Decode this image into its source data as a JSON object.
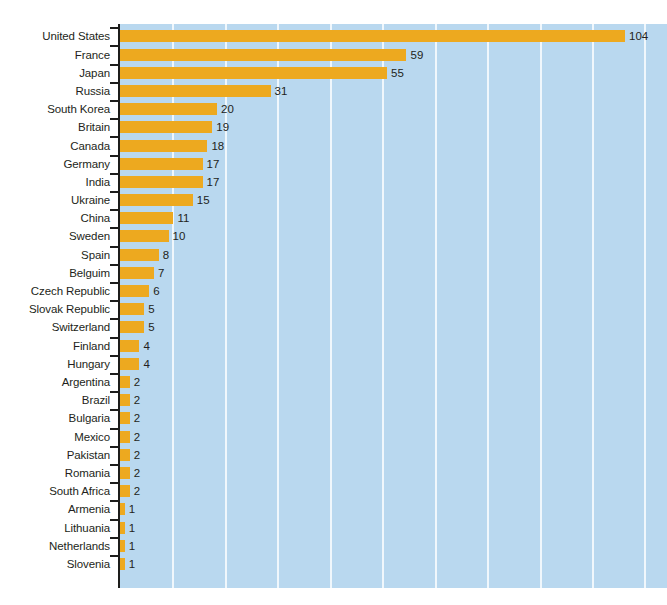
{
  "chart_data": {
    "type": "bar",
    "orientation": "horizontal",
    "title": "",
    "subtitle": "",
    "xlabel": "",
    "ylabel": "",
    "xlim": [
      0,
      112
    ],
    "grid": true,
    "grid_axis": "x",
    "legend": false,
    "bar_color": "#eda91f",
    "plot_background_color": "#b9d8ef",
    "gridline_color": "#f0f7fc",
    "axis_color": "#1d1d1b",
    "text_color": "#231f20",
    "page_background_color": "#ffffff",
    "value_labels_shown": true,
    "categories": [
      "United States",
      "France",
      "Japan",
      "Russia",
      "South Korea",
      "Britain",
      "Canada",
      "Germany",
      "India",
      "Ukraine",
      "China",
      "Sweden",
      "Spain",
      "Belguim",
      "Czech Republic",
      "Slovak Republic",
      "Switzerland",
      "Finland",
      "Hungary",
      "Argentina",
      "Brazil",
      "Bulgaria",
      "Mexico",
      "Pakistan",
      "Romania",
      "South Africa",
      "Armenia",
      "Lithuania",
      "Netherlands",
      "Slovenia"
    ],
    "values": [
      104,
      59,
      55,
      31,
      20,
      19,
      18,
      17,
      17,
      15,
      11,
      10,
      8,
      7,
      6,
      5,
      5,
      4,
      4,
      2,
      2,
      2,
      2,
      2,
      2,
      2,
      1,
      1,
      1,
      1
    ],
    "value_labels": [
      "104",
      "59",
      "55",
      "31",
      "20",
      "19",
      "18",
      "17",
      "17",
      "15",
      "11",
      "10",
      "8",
      "7",
      "6",
      "5",
      "5",
      "4",
      "4",
      "2",
      "2",
      "2",
      "2",
      "2",
      "2",
      "2",
      "1",
      "1",
      "1",
      "1"
    ],
    "gridline_values": [
      10.8,
      21.6,
      32.4,
      43.2,
      54,
      64.8,
      75.6,
      86.4,
      97.2,
      108
    ]
  }
}
